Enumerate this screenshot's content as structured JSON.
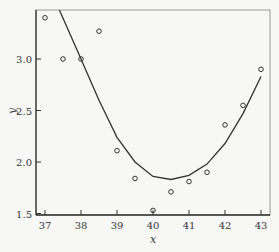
{
  "chart_data": {
    "type": "scatter",
    "title": "",
    "xlabel": "x",
    "ylabel": "y",
    "xlim": [
      36.75,
      43.25
    ],
    "ylim": [
      1.48,
      3.49
    ],
    "xticks": [
      37,
      38,
      39,
      40,
      41,
      42,
      43
    ],
    "yticks": [
      1.5,
      2.0,
      2.5,
      3.0
    ],
    "ytick_labels": [
      "1.5",
      "2.0",
      "2.5",
      "3.0"
    ],
    "grid": false,
    "series": [
      {
        "name": "observed",
        "style": "open-circle",
        "x": [
          37.0,
          37.5,
          38.0,
          38.5,
          39.0,
          39.5,
          40.0,
          40.5,
          41.0,
          41.5,
          42.0,
          42.5,
          43.0
        ],
        "y": [
          3.4,
          3.0,
          3.0,
          3.27,
          2.11,
          1.84,
          1.53,
          1.71,
          1.81,
          1.9,
          2.36,
          2.55,
          2.9
        ]
      },
      {
        "name": "fitted",
        "style": "line",
        "x": [
          37.4,
          38.0,
          38.5,
          39.0,
          39.5,
          40.0,
          40.5,
          41.0,
          41.5,
          42.0,
          42.5,
          43.0
        ],
        "y": [
          3.49,
          3.0,
          2.6,
          2.24,
          2.0,
          1.86,
          1.83,
          1.87,
          1.98,
          2.18,
          2.47,
          2.83
        ]
      }
    ]
  }
}
